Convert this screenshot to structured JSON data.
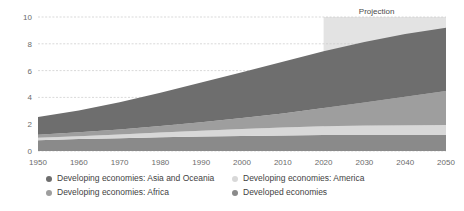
{
  "chart_data": {
    "type": "area",
    "stacked": true,
    "title": "",
    "subtitle": "",
    "xlabel": "",
    "ylabel": "",
    "xlim": [
      1950,
      2050
    ],
    "ylim": [
      0,
      10
    ],
    "grid": true,
    "legend_position": "bottom",
    "x": [
      1950,
      1960,
      1970,
      1980,
      1990,
      2000,
      2010,
      2020,
      2030,
      2040,
      2050
    ],
    "x_tick_labels": [
      "1950",
      "1960",
      "1970",
      "1980",
      "1990",
      "2000",
      "2010",
      "2020",
      "2030",
      "2040",
      "2050"
    ],
    "y_tick_labels": [
      "0",
      "2",
      "4",
      "6",
      "8",
      "10"
    ],
    "y_ticks": [
      0,
      2,
      4,
      6,
      8,
      10
    ],
    "series": [
      {
        "name": "Developed economies",
        "color": "#8a8a8a",
        "values": [
          0.81,
          0.89,
          0.96,
          1.02,
          1.08,
          1.12,
          1.16,
          1.19,
          1.2,
          1.2,
          1.19
        ]
      },
      {
        "name": "Developing economies: America",
        "color": "#d8d8d8",
        "values": [
          0.17,
          0.22,
          0.28,
          0.36,
          0.44,
          0.52,
          0.59,
          0.65,
          0.7,
          0.73,
          0.75
        ]
      },
      {
        "name": "Developing economies: Africa",
        "color": "#9e9e9e",
        "values": [
          0.23,
          0.29,
          0.37,
          0.48,
          0.63,
          0.82,
          1.05,
          1.36,
          1.72,
          2.12,
          2.53
        ]
      },
      {
        "name": "Developing economies: Asia and Oceania",
        "color": "#6e6e6e",
        "values": [
          1.33,
          1.62,
          2.03,
          2.48,
          2.96,
          3.42,
          3.86,
          4.24,
          4.52,
          4.68,
          4.72
        ]
      }
    ],
    "annotations": [
      {
        "name": "projection-label",
        "text": "Projection",
        "x": 2033
      }
    ],
    "projection": {
      "start_year": 2020,
      "end_year": 2050,
      "shade_color": "#e3e3e3",
      "label": "Projection"
    },
    "colors": {
      "grid": "#c9c9c9",
      "axis_text": "#6b6b6b",
      "legend_text": "#3f3f3f",
      "background": "#ffffff"
    }
  },
  "legend": {
    "columns": [
      {
        "items": [
          {
            "label": "Developing economies: Asia and Oceania",
            "color": "#6e6e6e"
          },
          {
            "label": "Developing economies: Africa",
            "color": "#9e9e9e"
          }
        ]
      },
      {
        "items": [
          {
            "label": "Developing economies: America",
            "color": "#d8d8d8"
          },
          {
            "label": "Developed economies",
            "color": "#8a8a8a"
          }
        ]
      }
    ]
  }
}
